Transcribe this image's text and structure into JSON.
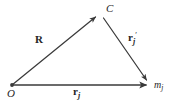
{
  "figure": {
    "type": "vector-triangle-diagram",
    "background_color": "#ffffff",
    "stroke_color": "#3a3a3a",
    "text_color": "#262626",
    "width": 171,
    "height": 103
  },
  "points": [
    {
      "id": "O",
      "label": "O",
      "x": 12,
      "y": 85,
      "role": "origin"
    },
    {
      "id": "C",
      "label": "C",
      "x": 100,
      "y": 15,
      "role": "center-of-mass"
    },
    {
      "id": "mj",
      "label": "m",
      "sub": "j",
      "x": 151,
      "y": 85,
      "role": "particle"
    }
  ],
  "vectors": [
    {
      "id": "R",
      "label": "R",
      "sub": "",
      "prime": "",
      "from": "O",
      "to": "C",
      "x1": 12,
      "y1": 85,
      "x2": 97,
      "y2": 16,
      "label_x": 35,
      "label_y": 34
    },
    {
      "id": "rj_prime",
      "label": "r",
      "sub": "j",
      "prime": "′",
      "from": "C",
      "to": "mj",
      "x1": 103,
      "y1": 17,
      "x2": 148,
      "y2": 82,
      "label_x": 128,
      "label_y": 32
    },
    {
      "id": "rj",
      "label": "r",
      "sub": "j",
      "prime": "",
      "from": "O",
      "to": "mj",
      "x1": 12,
      "y1": 85,
      "x2": 149,
      "y2": 85,
      "label_x": 73,
      "label_y": 86
    }
  ],
  "labels": {
    "origin": "O",
    "apex": "C",
    "mass": "m",
    "mass_sub": "j",
    "R": "R",
    "r": "r",
    "r_sub": "j",
    "prime": "′"
  }
}
